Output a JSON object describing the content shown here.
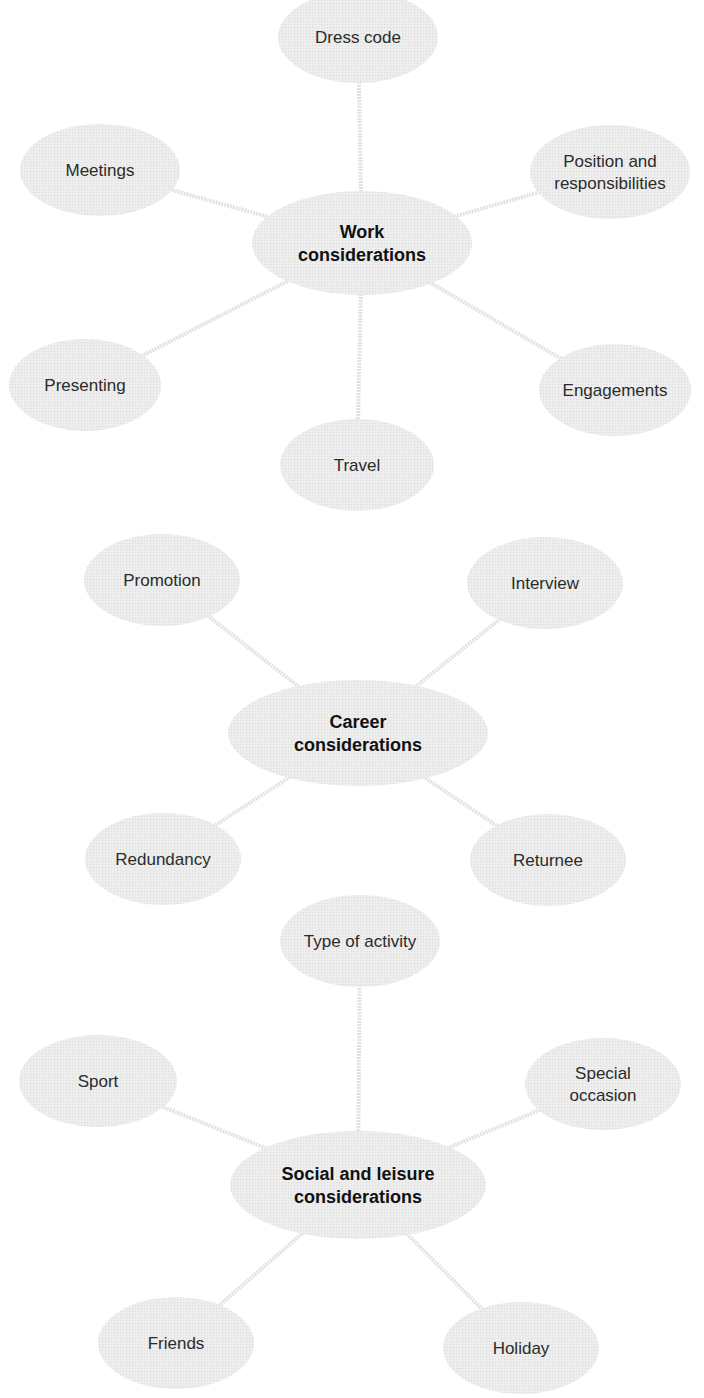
{
  "diagram": {
    "type": "mind-map",
    "colors": {
      "node_fill": "#e8e8e8",
      "connector": "#e2e2e2",
      "hub_text": "#111111",
      "node_text": "#2b2b2b"
    },
    "clusters": [
      {
        "hub": {
          "id": "work",
          "lines": [
            "Work",
            "considerations"
          ],
          "cx": 362,
          "cy": 243,
          "rx": 110,
          "ry": 52
        },
        "nodes": [
          {
            "id": "dress-code",
            "lines": [
              "Dress code"
            ],
            "cx": 358,
            "cy": 37,
            "rx": 80,
            "ry": 46
          },
          {
            "id": "meetings",
            "lines": [
              "Meetings"
            ],
            "cx": 100,
            "cy": 170,
            "rx": 80,
            "ry": 46
          },
          {
            "id": "position",
            "lines": [
              "Position and",
              "responsibilities"
            ],
            "cx": 610,
            "cy": 172,
            "rx": 80,
            "ry": 47
          },
          {
            "id": "presenting",
            "lines": [
              "Presenting"
            ],
            "cx": 85,
            "cy": 385,
            "rx": 76,
            "ry": 46
          },
          {
            "id": "engagements",
            "lines": [
              "Engagements"
            ],
            "cx": 615,
            "cy": 390,
            "rx": 76,
            "ry": 46
          },
          {
            "id": "travel",
            "lines": [
              "Travel"
            ],
            "cx": 357,
            "cy": 465,
            "rx": 77,
            "ry": 46
          }
        ]
      },
      {
        "hub": {
          "id": "career",
          "lines": [
            "Career",
            "considerations"
          ],
          "cx": 358,
          "cy": 733,
          "rx": 130,
          "ry": 53
        },
        "nodes": [
          {
            "id": "promotion",
            "lines": [
              "Promotion"
            ],
            "cx": 162,
            "cy": 580,
            "rx": 78,
            "ry": 46
          },
          {
            "id": "interview",
            "lines": [
              "Interview"
            ],
            "cx": 545,
            "cy": 583,
            "rx": 78,
            "ry": 46
          },
          {
            "id": "redundancy",
            "lines": [
              "Redundancy"
            ],
            "cx": 163,
            "cy": 859,
            "rx": 78,
            "ry": 46
          },
          {
            "id": "returnee",
            "lines": [
              "Returnee"
            ],
            "cx": 548,
            "cy": 860,
            "rx": 78,
            "ry": 46
          }
        ]
      },
      {
        "hub": {
          "id": "social",
          "lines": [
            "Social and leisure",
            "considerations"
          ],
          "cx": 358,
          "cy": 1185,
          "rx": 128,
          "ry": 54
        },
        "nodes": [
          {
            "id": "type-of-activity",
            "lines": [
              "Type of activity"
            ],
            "cx": 360,
            "cy": 941,
            "rx": 80,
            "ry": 46
          },
          {
            "id": "sport",
            "lines": [
              "Sport"
            ],
            "cx": 98,
            "cy": 1081,
            "rx": 79,
            "ry": 46
          },
          {
            "id": "special-occasion",
            "lines": [
              "Special",
              "occasion"
            ],
            "cx": 603,
            "cy": 1084,
            "rx": 78,
            "ry": 46
          },
          {
            "id": "friends",
            "lines": [
              "Friends"
            ],
            "cx": 176,
            "cy": 1343,
            "rx": 78,
            "ry": 46
          },
          {
            "id": "holiday",
            "lines": [
              "Holiday"
            ],
            "cx": 521,
            "cy": 1348,
            "rx": 78,
            "ry": 46
          }
        ]
      }
    ]
  }
}
